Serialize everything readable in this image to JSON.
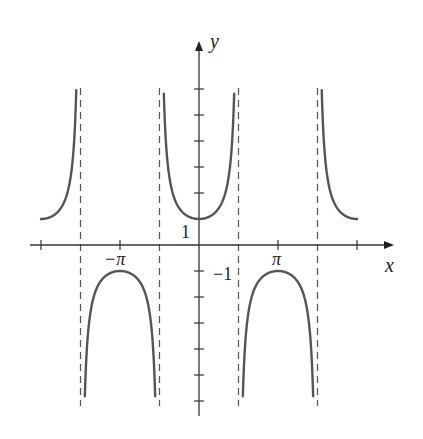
{
  "chart_data": {
    "type": "line",
    "title": "",
    "function": "y = sec(x)",
    "xlabel": "x",
    "ylabel": "y",
    "xlim": [
      -7.0,
      6.95
    ],
    "ylim": [
      -6.4,
      7.1
    ],
    "x_tick_values": [
      -6.2832,
      -3.1416,
      3.1416,
      6.2832
    ],
    "x_tick_labels": [
      "",
      "−π",
      "π",
      ""
    ],
    "y_tick_values": [
      -6,
      -5,
      -4,
      -3,
      -2,
      -1,
      1,
      2,
      3,
      4,
      5,
      6
    ],
    "y_tick_labels": {
      "1": "1",
      "-1": "−1"
    },
    "asymptotes_x": [
      -4.7124,
      -1.5708,
      1.5708,
      4.7124
    ],
    "series": [
      {
        "name": "sec(x) branch 1",
        "x_range": [
          -6.2832,
          -4.7124
        ],
        "values_sample": [
          [
            -6.2832,
            1
          ],
          [
            -5.5,
            1.41
          ],
          [
            -5.0,
            3.53
          ],
          [
            -4.88,
            6.0
          ]
        ]
      },
      {
        "name": "sec(x) branch 2",
        "x_range": [
          -4.7124,
          -1.5708
        ],
        "values_sample": [
          [
            -4.55,
            -6.0
          ],
          [
            -4.0,
            -1.53
          ],
          [
            -3.1416,
            -1
          ],
          [
            -2.3,
            -1.5
          ],
          [
            -1.74,
            -6.0
          ]
        ]
      },
      {
        "name": "sec(x) branch 3",
        "x_range": [
          -1.5708,
          1.5708
        ],
        "values_sample": [
          [
            -1.4,
            6.0
          ],
          [
            -1.0,
            1.85
          ],
          [
            0,
            1
          ],
          [
            1.0,
            1.85
          ],
          [
            1.4,
            6.0
          ]
        ]
      },
      {
        "name": "sec(x) branch 4",
        "x_range": [
          1.5708,
          4.7124
        ],
        "values_sample": [
          [
            1.74,
            -6.0
          ],
          [
            2.3,
            -1.5
          ],
          [
            3.1416,
            -1
          ],
          [
            4.0,
            -1.53
          ],
          [
            4.55,
            -6.0
          ]
        ]
      },
      {
        "name": "sec(x) branch 5",
        "x_range": [
          4.7124,
          6.2832
        ],
        "values_sample": [
          [
            4.88,
            6.0
          ],
          [
            5.0,
            3.53
          ],
          [
            5.5,
            1.41
          ],
          [
            6.2832,
            1
          ]
        ]
      }
    ],
    "clip_y": 6.0,
    "grid": false,
    "legend": null
  },
  "labels": {
    "x_axis": "x",
    "y_axis": "y",
    "neg_pi": "−π",
    "pi": "π",
    "one": "1",
    "neg_one": "−1"
  },
  "colors": {
    "curve": "#555555",
    "axis": "#333333",
    "asymptote": "#555555"
  }
}
